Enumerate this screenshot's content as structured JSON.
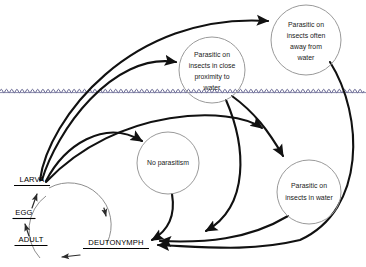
{
  "diagram": {
    "background_color": "#ffffff",
    "water_line": {
      "name": "water-surface-line",
      "color": "#5b5b89",
      "y": 91
    },
    "nodes": [
      {
        "id": "parasitic-away-from-water",
        "lines": [
          "Parasitic on",
          "insects often",
          "away from",
          "water"
        ],
        "cx": 306,
        "cy": 40,
        "r": 35,
        "stroke": "#9a9a9a"
      },
      {
        "id": "parasitic-close-proximity",
        "lines": [
          "Parasitic on",
          "insects in close",
          "proximity to",
          "water"
        ],
        "cx": 212,
        "cy": 70,
        "r": 33,
        "stroke": "#9a9a9a"
      },
      {
        "id": "no-parasitism",
        "lines": [
          "No parasitism"
        ],
        "cx": 168,
        "cy": 163,
        "r": 31,
        "stroke": "#9a9a9a"
      },
      {
        "id": "parasitic-in-water",
        "lines": [
          "Parasitic on",
          "insects in water"
        ],
        "cx": 309,
        "cy": 192,
        "r": 32,
        "stroke": "#9a9a9a"
      }
    ],
    "stages": [
      {
        "id": "larva",
        "label": "LARVA",
        "x": 32,
        "y": 182,
        "underline_width": 36
      },
      {
        "id": "egg",
        "label": "EGG",
        "x": 24,
        "y": 215,
        "underline_width": 23
      },
      {
        "id": "adult",
        "label": "ADULT",
        "x": 31,
        "y": 242,
        "underline_width": 33
      },
      {
        "id": "deutonymph",
        "label": "DEUTONYMPH",
        "x": 116,
        "y": 245,
        "underline_width": 66
      }
    ],
    "edges": [
      {
        "id": "larva-to-away-from-water",
        "from": "larva",
        "to": "parasitic-away-from-water"
      },
      {
        "id": "larva-to-close-proximity",
        "from": "larva",
        "to": "parasitic-close-proximity"
      },
      {
        "id": "larva-to-no-parasitism",
        "from": "larva",
        "to": "no-parasitism"
      },
      {
        "id": "close-proximity-to-in-water",
        "from": "parasitic-close-proximity",
        "to": "parasitic-in-water"
      },
      {
        "id": "away-from-water-to-deutonymph",
        "from": "parasitic-away-from-water",
        "to": "deutonymph"
      },
      {
        "id": "close-proximity-to-deutonymph",
        "from": "parasitic-close-proximity",
        "to": "deutonymph"
      },
      {
        "id": "in-water-to-deutonymph",
        "from": "parasitic-in-water",
        "to": "deutonymph"
      },
      {
        "id": "no-parasitism-to-deutonymph",
        "from": "no-parasitism",
        "to": "deutonymph"
      },
      {
        "id": "larva-to-deutonymph",
        "from": "larva",
        "to": "deutonymph"
      },
      {
        "id": "deutonymph-to-adult",
        "from": "deutonymph",
        "to": "adult"
      },
      {
        "id": "adult-to-egg",
        "from": "adult",
        "to": "egg"
      },
      {
        "id": "egg-to-larva",
        "from": "egg",
        "to": "larva"
      }
    ]
  }
}
